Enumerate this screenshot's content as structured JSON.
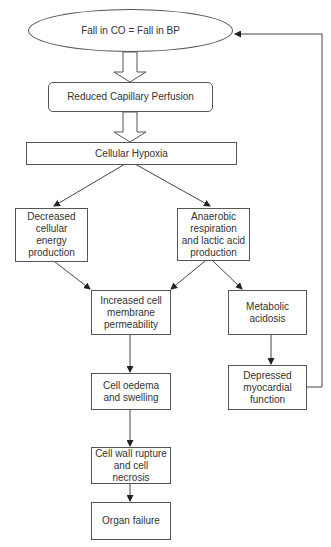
{
  "diagram": {
    "type": "flowchart",
    "nodes": {
      "start": {
        "label": "Fall in CO = Fall in BP",
        "shape": "ellipse"
      },
      "perfusion": {
        "label": "Reduced Capillary Perfusion",
        "shape": "rounded-rect"
      },
      "hypoxia": {
        "label": "Cellular Hypoxia",
        "shape": "rect"
      },
      "energy": {
        "label": "Decreased cellular energy production",
        "shape": "rect"
      },
      "anaerobic": {
        "label": "Anaerobic respiration and lactic acid production",
        "shape": "rect"
      },
      "permeability": {
        "label": "Increased cell membrane permeability",
        "shape": "rect"
      },
      "acidosis": {
        "label": "Metabolic acidosis",
        "shape": "rect"
      },
      "oedema": {
        "label": "Cell oedema and swelling",
        "shape": "rect"
      },
      "myocardial": {
        "label": "Depressed myocardial function",
        "shape": "rect"
      },
      "rupture": {
        "label": "Cell wall rupture and cell necrosis",
        "shape": "rect"
      },
      "organ": {
        "label": "Organ failure",
        "shape": "rect"
      }
    },
    "edges": [
      {
        "from": "start",
        "to": "perfusion",
        "style": "hollow-block-arrow"
      },
      {
        "from": "perfusion",
        "to": "hypoxia",
        "style": "hollow-block-arrow"
      },
      {
        "from": "hypoxia",
        "to": "energy"
      },
      {
        "from": "hypoxia",
        "to": "anaerobic"
      },
      {
        "from": "energy",
        "to": "permeability"
      },
      {
        "from": "anaerobic",
        "to": "permeability"
      },
      {
        "from": "anaerobic",
        "to": "acidosis"
      },
      {
        "from": "permeability",
        "to": "oedema"
      },
      {
        "from": "acidosis",
        "to": "myocardial"
      },
      {
        "from": "oedema",
        "to": "rupture"
      },
      {
        "from": "rupture",
        "to": "organ"
      },
      {
        "from": "myocardial",
        "to": "start",
        "style": "feedback-loop"
      }
    ],
    "colors": {
      "line": "#444444",
      "box_border": "#555555",
      "text": "#333333",
      "background": "#ffffff"
    }
  }
}
